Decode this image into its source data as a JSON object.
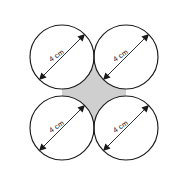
{
  "figure": {
    "canvas": {
      "width": 184,
      "height": 184,
      "background": "#ffffff"
    },
    "colors": {
      "stroke": "#1a1a1a",
      "circle_fill": "#ffffff",
      "shaded_region_fill": "#cfcfcf",
      "watermark": "#d8d8d8"
    },
    "circles": [
      {
        "id": "top-left",
        "cx": 62,
        "cy": 57,
        "r": 32,
        "label": "4 cm",
        "label_rotation": -33,
        "arrow_from": {
          "x": 39.5,
          "y": 79.5
        },
        "arrow_to": {
          "x": 84.5,
          "y": 34.5
        }
      },
      {
        "id": "top-right",
        "cx": 126,
        "cy": 57,
        "r": 32,
        "label": "4 cm",
        "label_rotation": -33,
        "arrow_from": {
          "x": 103.5,
          "y": 79.5
        },
        "arrow_to": {
          "x": 148.5,
          "y": 34.5
        }
      },
      {
        "id": "bottom-left",
        "cx": 62,
        "cy": 128,
        "r": 32,
        "label": "4 cm",
        "label_rotation": -33,
        "arrow_from": {
          "x": 39.5,
          "y": 150.5
        },
        "arrow_to": {
          "x": 84.5,
          "y": 105.5
        }
      },
      {
        "id": "bottom-right",
        "cx": 126,
        "cy": 128,
        "r": 32,
        "label": "4 cm",
        "label_rotation": -33,
        "arrow_from": {
          "x": 103.5,
          "y": 150.5
        },
        "arrow_to": {
          "x": 148.5,
          "y": 105.5
        }
      }
    ],
    "shaded_region": {
      "id": "center-concave-square",
      "description": "concave square between the four mutually tangent circles",
      "fill": "#cfcfcf",
      "corners": [
        {
          "x": 94,
          "y": 57
        },
        {
          "x": 126,
          "y": 92.5
        },
        {
          "x": 94,
          "y": 128
        },
        {
          "x": 62,
          "y": 92.5
        }
      ]
    },
    "watermark": {
      "lines": [
        {
          "text": "",
          "x": 8,
          "y": 72
        },
        {
          "text": "",
          "x": 8,
          "y": 148
        }
      ]
    }
  }
}
